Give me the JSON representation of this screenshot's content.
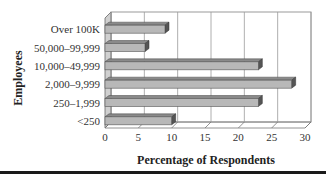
{
  "chart_data": {
    "type": "bar",
    "orientation": "horizontal",
    "style": "3d",
    "title": "",
    "xlabel": "Percentage of Respondents",
    "ylabel": "Employees",
    "categories": [
      "Over 100K",
      "50,000–99,999",
      "10,000–49,999",
      "2,000–9,999",
      "250–1,999",
      "<250"
    ],
    "values": [
      9,
      6,
      23,
      28,
      23,
      10
    ],
    "xlim": [
      0,
      30
    ],
    "xticks": [
      0,
      5,
      10,
      15,
      20,
      25,
      30
    ],
    "grid": true,
    "legend": null
  },
  "colors": {
    "bar_face": "#b8b8b8",
    "bar_top": "#8a8a8a",
    "bar_end": "#555555",
    "grid": "#9a9a9a",
    "rule": "#1a1a1a"
  }
}
